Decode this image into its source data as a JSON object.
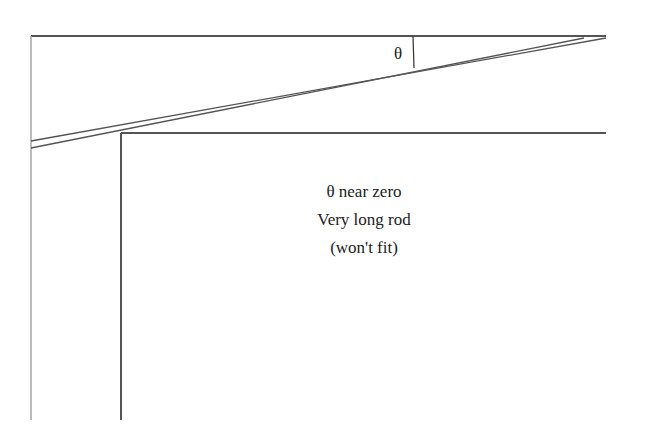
{
  "diagram": {
    "theta_symbol": "θ",
    "caption_lines": [
      "θ near zero",
      "Very long rod",
      "(won't fit)"
    ],
    "colors": {
      "lines": "#555555",
      "text": "#222222",
      "background": "#ffffff"
    }
  }
}
